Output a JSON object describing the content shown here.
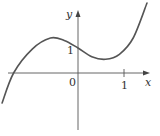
{
  "chart_data": {
    "type": "line",
    "title": "",
    "xlabel": "x",
    "ylabel": "y",
    "x_ticks": [
      {
        "value": 1,
        "label": "1"
      }
    ],
    "y_ticks": [
      {
        "value": 1,
        "label": "1"
      }
    ],
    "origin_label": "0",
    "xlim": [
      -1.7,
      1.7
    ],
    "ylim": [
      -2.3,
      2.9
    ],
    "grid": false,
    "legend": null,
    "series": [
      {
        "name": "curve",
        "x": [
          -1.65,
          -1.4,
          -1.0,
          -0.6,
          -0.3,
          0.0,
          0.3,
          0.6,
          0.9,
          1.2,
          1.5
        ],
        "y": [
          -1.2,
          0.0,
          0.95,
          1.4,
          1.3,
          1.0,
          0.65,
          0.55,
          0.75,
          1.4,
          2.8
        ]
      }
    ]
  },
  "labels": {
    "x_axis": "x",
    "y_axis": "y",
    "origin": "0",
    "x_tick_1": "1",
    "y_tick_1": "1"
  }
}
